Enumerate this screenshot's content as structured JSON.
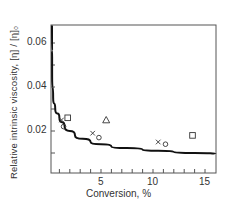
{
  "chart_data": {
    "type": "scatter",
    "title": "",
    "xlabel": "Conversion, %",
    "ylabel": "Relative intrinsic viscosity, [η] / [η]₀",
    "xlim": [
      0,
      16
    ],
    "ylim": [
      0,
      0.068
    ],
    "grid": false,
    "legend": null,
    "x_ticks": [
      5,
      10,
      15
    ],
    "x_tick_labels": [
      "5",
      "10",
      "15"
    ],
    "x_minor_ticks": [
      1,
      2,
      3,
      4,
      5,
      6,
      7,
      8,
      9,
      10,
      11,
      12,
      13,
      14,
      15
    ],
    "y_ticks": [
      0.02,
      0.04,
      0.06
    ],
    "y_tick_labels": [
      "0.02",
      "0.04",
      "0.06"
    ],
    "y_minor_ticks": [
      0.01,
      0.03,
      0.05
    ],
    "series": [
      {
        "name": "x markers",
        "marker": "x",
        "points": [
          [
            1.2,
            0.025
          ],
          [
            4.2,
            0.019
          ],
          [
            10.5,
            0.015
          ]
        ]
      },
      {
        "name": "circle markers",
        "marker": "circle",
        "points": [
          [
            1.4,
            0.022
          ],
          [
            4.8,
            0.017
          ],
          [
            11.2,
            0.014
          ]
        ]
      },
      {
        "name": "square markers",
        "marker": "square",
        "points": [
          [
            1.8,
            0.026
          ],
          [
            13.8,
            0.018
          ]
        ]
      },
      {
        "name": "triangle markers",
        "marker": "triangle",
        "points": [
          [
            5.5,
            0.025
          ]
        ]
      },
      {
        "name": "fitted curve",
        "marker": "line",
        "points": [
          [
            0.2,
            0.068
          ],
          [
            0.3,
            0.045
          ],
          [
            0.4,
            0.035
          ],
          [
            0.6,
            0.03
          ],
          [
            1.0,
            0.026
          ],
          [
            1.5,
            0.022
          ],
          [
            2.5,
            0.018
          ],
          [
            4.0,
            0.015
          ],
          [
            6.0,
            0.013
          ],
          [
            9.0,
            0.0115
          ],
          [
            12.0,
            0.0105
          ],
          [
            16.0,
            0.0095
          ]
        ]
      }
    ]
  }
}
